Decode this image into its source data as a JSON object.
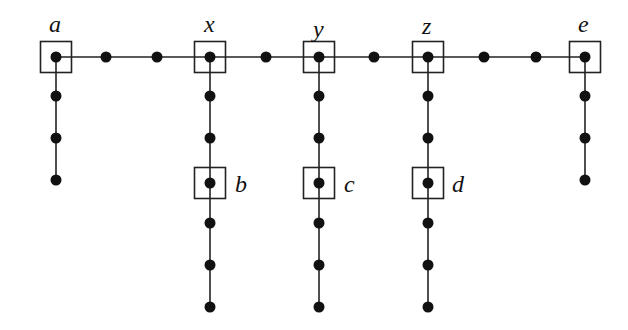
{
  "diagram": {
    "title": "",
    "style": {
      "node_color": "#111111",
      "edge_color": "#222222",
      "background": "#ffffff"
    },
    "labeled_nodes": [
      {
        "id": "a",
        "label": "a",
        "x": 56,
        "y": 57,
        "boxed": true,
        "label_pos": "above"
      },
      {
        "id": "x",
        "label": "x",
        "x": 210,
        "y": 57,
        "boxed": true,
        "label_pos": "above"
      },
      {
        "id": "y",
        "label": "y",
        "x": 319,
        "y": 57,
        "boxed": true,
        "label_pos": "above"
      },
      {
        "id": "z",
        "label": "z",
        "x": 428,
        "y": 57,
        "boxed": true,
        "label_pos": "above"
      },
      {
        "id": "e",
        "label": "e",
        "x": 585,
        "y": 57,
        "boxed": true,
        "label_pos": "above"
      },
      {
        "id": "b",
        "label": "b",
        "x": 210,
        "y": 183,
        "boxed": true,
        "label_pos": "right"
      },
      {
        "id": "c",
        "label": "c",
        "x": 319,
        "y": 183,
        "boxed": true,
        "label_pos": "right"
      },
      {
        "id": "d",
        "label": "d",
        "x": 428,
        "y": 183,
        "boxed": true,
        "label_pos": "right"
      }
    ],
    "spine": {
      "y": 57,
      "x_start": 56,
      "x_end": 585,
      "intermediate_nodes_x": [
        106,
        157,
        266,
        374,
        484,
        536
      ]
    },
    "branches": [
      {
        "from": "a",
        "x": 56,
        "nodes_y": [
          96,
          138,
          180
        ]
      },
      {
        "from": "x",
        "x": 210,
        "nodes_y": [
          96,
          138,
          183,
          223,
          265,
          307
        ]
      },
      {
        "from": "y",
        "x": 319,
        "nodes_y": [
          96,
          138,
          183,
          223,
          265,
          307
        ]
      },
      {
        "from": "z",
        "x": 428,
        "nodes_y": [
          96,
          138,
          183,
          223,
          265,
          307
        ]
      },
      {
        "from": "e",
        "x": 585,
        "nodes_y": [
          96,
          138,
          180
        ]
      }
    ]
  }
}
